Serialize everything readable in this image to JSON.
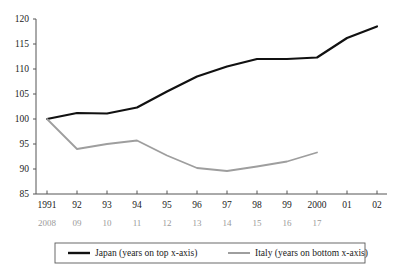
{
  "chart_data": {
    "type": "line",
    "title": "",
    "subtitle": "",
    "xlabel": "",
    "ylabel": "",
    "ylim": [
      85,
      120
    ],
    "y_ticks": [
      85,
      90,
      95,
      100,
      105,
      110,
      115,
      120
    ],
    "grid": false,
    "legend_position": "bottom",
    "x_axis_top": {
      "name": "years on top x-axis",
      "tick_labels": [
        "1991",
        "92",
        "93",
        "94",
        "95",
        "96",
        "97",
        "98",
        "99",
        "2000",
        "01",
        "02"
      ]
    },
    "x_axis_bottom": {
      "name": "years on bottom x-axis",
      "tick_labels": [
        "2008",
        "09",
        "10",
        "11",
        "12",
        "13",
        "14",
        "15",
        "16",
        "17"
      ]
    },
    "series": [
      {
        "name": "Japan (years on top x-axis)",
        "color": "#111111",
        "axis": "top",
        "x": [
          "1991",
          "92",
          "93",
          "94",
          "95",
          "96",
          "97",
          "98",
          "99",
          "2000",
          "01",
          "02"
        ],
        "values": [
          100.0,
          101.2,
          101.1,
          102.3,
          105.5,
          108.5,
          110.5,
          112.0,
          112.0,
          112.3,
          116.2,
          118.5
        ]
      },
      {
        "name": "Italy  (years on bottom x-axis)",
        "color": "#9e9e9e",
        "axis": "bottom",
        "x": [
          "2008",
          "09",
          "10",
          "11",
          "12",
          "13",
          "14",
          "15",
          "16",
          "17"
        ],
        "values": [
          100.0,
          94.0,
          95.0,
          95.7,
          92.7,
          90.2,
          89.6,
          90.5,
          91.5,
          93.3
        ]
      }
    ]
  },
  "legend": {
    "items": [
      {
        "label": "Japan (years on top x-axis)",
        "color": "#111111"
      },
      {
        "label": "Italy  (years on bottom x-axis)",
        "color": "#9e9e9e"
      }
    ]
  }
}
